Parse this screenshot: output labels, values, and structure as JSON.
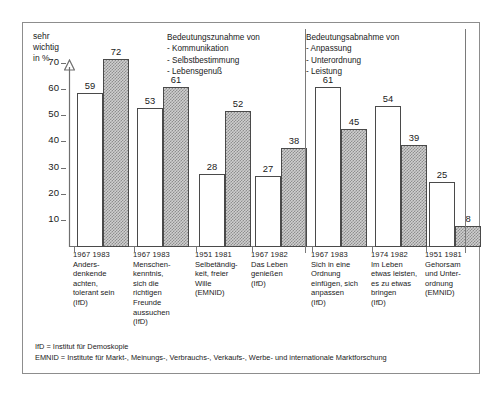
{
  "chart_data": {
    "type": "bar",
    "title": "",
    "ylabel": "sehr\nwichtig\nin %",
    "xlabel": "",
    "ylim": [
      0,
      78
    ],
    "yticks": [
      10,
      20,
      30,
      40,
      50,
      60,
      70
    ],
    "grid": false,
    "legend": "none",
    "series": [
      {
        "name": "erster Zeitpunkt",
        "style": "white",
        "values": [
          59,
          53,
          28,
          27,
          61,
          54,
          25
        ]
      },
      {
        "name": "zweiter Zeitpunkt",
        "style": "hatched",
        "values": [
          72,
          61,
          52,
          38,
          45,
          39,
          8
        ]
      }
    ],
    "categories": [
      "1967 1983 Andersdenkende achten, tolerant sein (IfD)",
      "1967 1983 Menschenkenntnis, sich die richtigen Freunde aussuchen (IfD)",
      "1951 1981 Selbetändigkeit, freier Wille (EMNID)",
      "1967 1982 Das Leben genießen (IfD)",
      "1967 1983 Sich in eine Ordnung einfügen, sich anpassen (IfD)",
      "1974 1982 Im Leben etwas leisten, es zu etwas bringen (IfD)",
      "1951 1981 Gehorsam und Unterordnung (EMNID)"
    ],
    "annotations": [
      "Bedeutungszunahme von - Kommunikation - Selbstbestimmung - Lebensgenuß",
      "Bedeutungsabnahme von - Anpassung - Unterordnung - Leistung"
    ]
  },
  "axis": {
    "y_title": "sehr\nwichtig\nin %",
    "y_ticks": [
      "70",
      "60",
      "50",
      "40",
      "30",
      "20",
      "10"
    ]
  },
  "sections": [
    {
      "title": "Bedeutungszunahme von",
      "items": [
        "- Kommunikation",
        "- Selbstbestimmung",
        "- Lebensgenuß"
      ]
    },
    {
      "title": "Bedeutungsabnahme von",
      "items": [
        "- Anpassung",
        "- Unterordnung",
        "- Leistung"
      ]
    }
  ],
  "groups": [
    {
      "years": "1967 1983",
      "caption": "Anders-\ndenkende\nachten,\ntolerant sein\n(IfD)",
      "bar1": {
        "value": "59",
        "n": 59
      },
      "bar2": {
        "value": "72",
        "n": 72
      }
    },
    {
      "years": "1967 1983",
      "caption": "Menschen-\nkenntnis,\nsich die\nrichtigen\nFreunde\naussuchen\n(IfD)",
      "bar1": {
        "value": "53",
        "n": 53
      },
      "bar2": {
        "value": "61",
        "n": 61
      }
    },
    {
      "years": "1951 1981",
      "caption": "Selbetändig-\nkeit, freier\nWille\n(EMNID)",
      "bar1": {
        "value": "28",
        "n": 28
      },
      "bar2": {
        "value": "52",
        "n": 52
      }
    },
    {
      "years": "1967 1982",
      "caption": "Das Leben\ngenießen\n(IfD)",
      "bar1": {
        "value": "27",
        "n": 27
      },
      "bar2": {
        "value": "38",
        "n": 38
      }
    },
    {
      "years": "1967 1983",
      "caption": "Sich in eine\nOrdnung\neinfügen, sich\nanpassen\n(IfD)",
      "bar1": {
        "value": "61",
        "n": 61
      },
      "bar2": {
        "value": "45",
        "n": 45
      }
    },
    {
      "years": "1974 1982",
      "caption": "Im Leben\netwas leisten,\nes zu etwas\nbringen\n(IfD)",
      "bar1": {
        "value": "54",
        "n": 54
      },
      "bar2": {
        "value": "39",
        "n": 39
      }
    },
    {
      "years": "1951 1981",
      "caption": "Gehorsam\nund Unter-\nordnung\n(EMNID)",
      "bar1": {
        "value": "25",
        "n": 25
      },
      "bar2": {
        "value": "8",
        "n": 8
      }
    }
  ],
  "footnotes": [
    "IfD = Institut für Demoskopie",
    "EMNID = Institute für Markt-, Meinungs-, Verbrauchs-, Verkaufs-, Werbe- und internationale Marktforschung"
  ],
  "colors": {
    "frame": "#8d8d8d",
    "axis": "#6f6f6f",
    "bar_outline": "#4a4a4a",
    "bar_light_fill": "#ffffff",
    "bar_hatch_fill": "#cfcfcf",
    "text": "#1a1a1a"
  }
}
